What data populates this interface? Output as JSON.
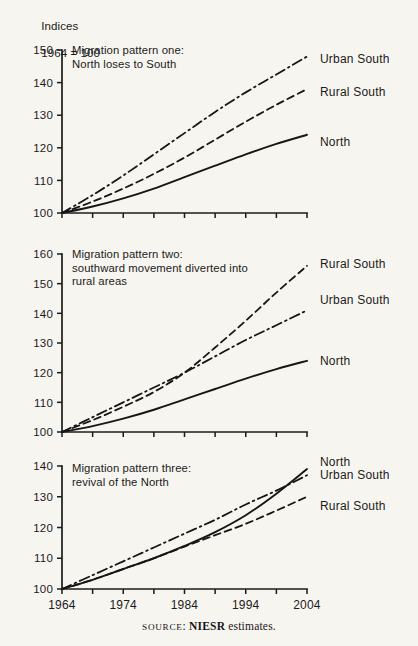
{
  "figure": {
    "axis_header_line1": "Indices",
    "axis_header_line2": "1964 = 100",
    "source_prefix": "SOURCE",
    "source_sep": ": ",
    "source_org": "NIESR",
    "source_rest": " estimates.",
    "background_color": "#f7f5f0",
    "ink_color": "#161616"
  },
  "chart_data": [
    {
      "type": "line",
      "title": "Migration pattern one:\nNorth loses to South",
      "title_lines": [
        "Migration pattern one:",
        "North loses to South"
      ],
      "xlabel": "",
      "ylabel": "Indices 1964 = 100",
      "xlim": [
        1964,
        2004
      ],
      "ylim": [
        100,
        150
      ],
      "yticks": [
        100,
        110,
        120,
        130,
        140,
        150
      ],
      "ytick_labels": [
        "100",
        "110",
        "120",
        "130",
        "140",
        "150"
      ],
      "xticks": [
        1964,
        1969,
        1974,
        1979,
        1984,
        1989,
        1994,
        1999,
        2004
      ],
      "xtick_labels": [
        "1964",
        "",
        "1974",
        "",
        "1984",
        "",
        "1994",
        "",
        "2004"
      ],
      "grid": false,
      "legend_position": "right-of-axes",
      "x": [
        1964,
        1969,
        1974,
        1979,
        1984,
        1989,
        1994,
        1999,
        2004
      ],
      "series": [
        {
          "name": "Urban South",
          "style": "dash-dot",
          "values": [
            100,
            105.5,
            111.5,
            118,
            124.5,
            131,
            137,
            142.5,
            148
          ]
        },
        {
          "name": "Rural South",
          "style": "dashed",
          "values": [
            100,
            103.5,
            107.5,
            112,
            117,
            122.5,
            128,
            133.2,
            138
          ]
        },
        {
          "name": "North",
          "style": "solid",
          "values": [
            100,
            102,
            104.5,
            107.5,
            111,
            114.5,
            118,
            121.2,
            124
          ]
        }
      ]
    },
    {
      "type": "line",
      "title": "Migration pattern two:\nsouthward movement diverted into\nrural areas",
      "title_lines": [
        "Migration pattern two:",
        "southward movement diverted into",
        "rural areas"
      ],
      "xlabel": "",
      "ylabel": "Indices 1964 = 100",
      "xlim": [
        1964,
        2004
      ],
      "ylim": [
        100,
        160
      ],
      "yticks": [
        100,
        110,
        120,
        130,
        140,
        150,
        160
      ],
      "ytick_labels": [
        "100",
        "110",
        "120",
        "130",
        "140",
        "150",
        "160"
      ],
      "xticks": [
        1964,
        1969,
        1974,
        1979,
        1984,
        1989,
        1994,
        1999,
        2004
      ],
      "xtick_labels": [
        "1964",
        "",
        "1974",
        "",
        "1984",
        "",
        "1994",
        "",
        "2004"
      ],
      "grid": false,
      "legend_position": "right-of-axes",
      "x": [
        1964,
        1969,
        1974,
        1979,
        1984,
        1989,
        1994,
        1999,
        2004
      ],
      "series": [
        {
          "name": "Rural South",
          "style": "dashed",
          "values": [
            100,
            104,
            108.5,
            113.5,
            120,
            128.5,
            137.5,
            147,
            156
          ]
        },
        {
          "name": "Urban South",
          "style": "dash-dot",
          "values": [
            100,
            105,
            110,
            115,
            120,
            125.5,
            131,
            136,
            141
          ]
        },
        {
          "name": "North",
          "style": "solid",
          "values": [
            100,
            102,
            104.5,
            107.5,
            111,
            114.5,
            118,
            121.2,
            124
          ]
        }
      ]
    },
    {
      "type": "line",
      "title": "Migration pattern three:\nrevival of the North",
      "title_lines": [
        "Migration pattern three:",
        "revival of the North"
      ],
      "xlabel": "",
      "ylabel": "Indices 1964 = 100",
      "xlim": [
        1964,
        2004
      ],
      "ylim": [
        100,
        140
      ],
      "yticks": [
        100,
        110,
        120,
        130,
        140
      ],
      "ytick_labels": [
        "100",
        "110",
        "120",
        "130",
        "140"
      ],
      "xticks": [
        1964,
        1969,
        1974,
        1979,
        1984,
        1989,
        1994,
        1999,
        2004
      ],
      "xtick_labels": [
        "1964",
        "",
        "1974",
        "",
        "1984",
        "",
        "1994",
        "",
        "2004"
      ],
      "grid": false,
      "legend_position": "right-of-axes",
      "x": [
        1964,
        1969,
        1974,
        1979,
        1984,
        1989,
        1994,
        1999,
        2004
      ],
      "series": [
        {
          "name": "North",
          "style": "solid",
          "values": [
            100,
            103,
            106.5,
            110,
            114,
            118.5,
            124,
            131,
            139
          ]
        },
        {
          "name": "Urban South",
          "style": "dash-dot",
          "values": [
            100,
            104.5,
            109,
            113.5,
            118,
            122.5,
            127.5,
            132,
            137
          ]
        },
        {
          "name": "Rural South",
          "style": "dashed",
          "values": [
            100,
            103,
            106.5,
            110,
            113.8,
            117.5,
            121.2,
            125.5,
            130
          ]
        }
      ]
    }
  ]
}
